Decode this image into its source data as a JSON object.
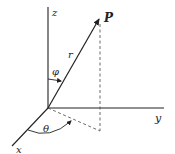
{
  "diagram": {
    "type": "spherical-coordinates",
    "colors": {
      "ink": "#222222",
      "background": "#ffffff"
    },
    "labels": {
      "z": "z",
      "y": "y",
      "x": "x",
      "point": "P",
      "radius": "r",
      "polar_angle": "φ",
      "azimuth_angle": "θ"
    }
  }
}
